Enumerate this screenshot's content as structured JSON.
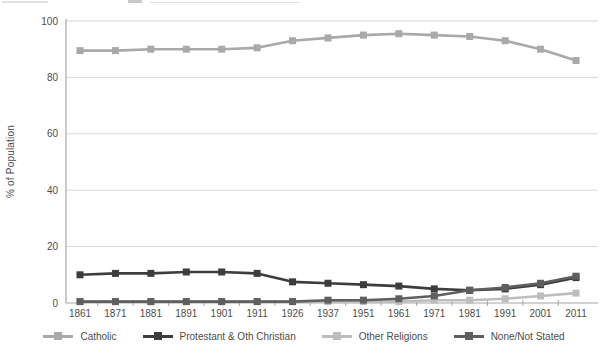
{
  "chart_data": {
    "type": "line",
    "title": "",
    "xlabel": "",
    "ylabel": "% of Population",
    "ylim": [
      0,
      100
    ],
    "y_ticks": [
      0,
      20,
      40,
      60,
      80,
      100
    ],
    "grid": "horizontal",
    "legend_position": "bottom",
    "categories": [
      "1861",
      "1871",
      "1881",
      "1891",
      "1901",
      "1911",
      "1926",
      "1937",
      "1951",
      "1961",
      "1971",
      "1981",
      "1991",
      "2001",
      "2011"
    ],
    "series": [
      {
        "name": "Catholic",
        "color": "#a9a9a9",
        "values": [
          89.5,
          89.5,
          90,
          90,
          90,
          90.5,
          93,
          94,
          95,
          95.5,
          95,
          94.5,
          93,
          90,
          86
        ]
      },
      {
        "name": "Protestant & Oth Christian",
        "color": "#3d3d3d",
        "values": [
          10,
          10.5,
          10.5,
          11,
          11,
          10.5,
          7.5,
          7,
          6.5,
          6,
          5,
          4.5,
          5,
          6.5,
          9
        ]
      },
      {
        "name": "Other Religions",
        "color": "#bdbdbd",
        "values": [
          0.5,
          0.5,
          0.5,
          0.5,
          0.5,
          0.5,
          0.5,
          0.5,
          0.5,
          0.5,
          1,
          1,
          1.5,
          2.5,
          3.5
        ]
      },
      {
        "name": "None/Not Stated",
        "color": "#5f5f5f",
        "values": [
          0.5,
          0.5,
          0.5,
          0.5,
          0.5,
          0.5,
          0.5,
          1,
          1,
          1.5,
          2.5,
          4.5,
          5.5,
          7,
          9.5
        ]
      }
    ],
    "colors": {
      "gridline": "#d9d9d9",
      "axis": "#a6a6a6",
      "tick_label": "#4d4d4d"
    }
  }
}
